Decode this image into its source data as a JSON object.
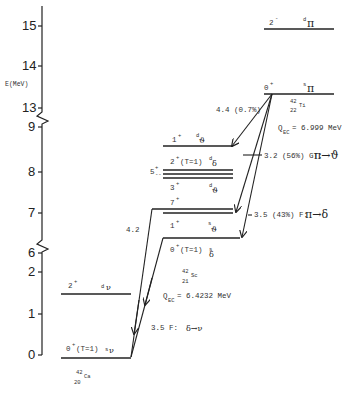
{
  "axis": {
    "label": "E(MeV)",
    "upper_ticks": [
      "15",
      "14",
      "13",
      "9"
    ],
    "middle_ticks": [
      "8",
      "7",
      "6",
      "2"
    ],
    "lower_ticks": [
      "1",
      "0"
    ]
  },
  "nuclei": {
    "ti": {
      "mass": "42",
      "z": "22",
      "symbol": "Ti",
      "q_label": "Q",
      "q_sub": "EC",
      "q_value": "= 6.999 MeV"
    },
    "sc": {
      "mass": "42",
      "z": "21",
      "symbol": "Sc",
      "q_label": "Q",
      "q_sub": "EC",
      "q_value": "= 6.4232 MeV"
    },
    "ca": {
      "mass": "42",
      "z": "20",
      "symbol": "Ca"
    }
  },
  "levels": {
    "ti_2minus": {
      "spin": "2",
      "parity": "-",
      "config": "d",
      "orbital": "π"
    },
    "ti_0plus": {
      "spin": "0",
      "parity": "+",
      "config": "s",
      "orbital": "π"
    },
    "sc_1plus_high": {
      "spin": "1",
      "parity": "+",
      "config": "d",
      "orbital": "ϑ"
    },
    "sc_2plus": {
      "spin": "2",
      "parity": "+",
      "extra": "(T=1)",
      "config": "d",
      "orbital": "δ"
    },
    "sc_5plus": {
      "spin": "5",
      "parity": "+"
    },
    "sc_3plus": {
      "spin": "3",
      "parity": "+",
      "config": "d",
      "orbital": "ϑ"
    },
    "sc_7plus": {
      "spin": "7",
      "parity": "+"
    },
    "sc_1plus_low": {
      "spin": "1",
      "parity": "+",
      "config": "s",
      "orbital": "ϑ"
    },
    "sc_0plus": {
      "spin": "0",
      "parity": "+",
      "extra": "(T=1)",
      "config": "s",
      "orbital": "δ"
    },
    "ca_2plus": {
      "spin": "2",
      "parity": "+",
      "config": "d",
      "orbital": "ν"
    },
    "ca_0plus": {
      "spin": "0",
      "parity": "+",
      "extra": "(T=1)",
      "config": "s",
      "orbital": "ν"
    }
  },
  "transitions": {
    "t1": {
      "label": "4.4 (0.7%)"
    },
    "t2": {
      "label": "3.2 (56%) GT:",
      "formula": "π→ϑ"
    },
    "t3": {
      "label": "3.5 (43%) F:",
      "formula": "π→δ"
    },
    "t4": {
      "label": "4.2"
    },
    "t5": {
      "label": "3.5   F:",
      "formula": "δ→ν"
    }
  }
}
